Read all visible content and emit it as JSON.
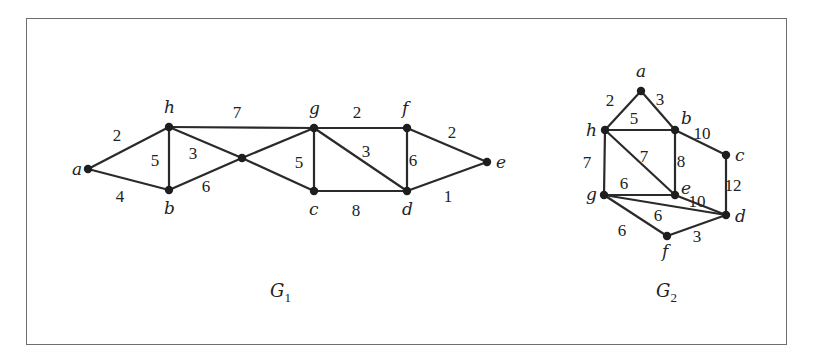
{
  "figure": {
    "graphs": [
      {
        "id": "G1",
        "caption": "G",
        "caption_sub": "1",
        "caption_pos": [
          270,
          297
        ],
        "nodes": [
          {
            "id": "a",
            "label": "a",
            "x": 88,
            "y": 169,
            "lx": 72,
            "ly": 175
          },
          {
            "id": "h",
            "label": "h",
            "x": 169,
            "y": 127,
            "lx": 164,
            "ly": 113
          },
          {
            "id": "b",
            "label": "b",
            "x": 169,
            "y": 190,
            "lx": 164,
            "ly": 214
          },
          {
            "id": "x",
            "label": "",
            "x": 242,
            "y": 158,
            "lx": 0,
            "ly": 0
          },
          {
            "id": "g",
            "label": "g",
            "x": 314,
            "y": 128,
            "lx": 309,
            "ly": 114
          },
          {
            "id": "c",
            "label": "c",
            "x": 314,
            "y": 191,
            "lx": 309,
            "ly": 215
          },
          {
            "id": "f",
            "label": "f",
            "x": 407,
            "y": 128,
            "lx": 402,
            "ly": 114
          },
          {
            "id": "d",
            "label": "d",
            "x": 407,
            "y": 191,
            "lx": 402,
            "ly": 215
          },
          {
            "id": "e",
            "label": "e",
            "x": 487,
            "y": 162,
            "lx": 496,
            "ly": 168
          }
        ],
        "edges": [
          {
            "from": "a",
            "to": "h",
            "w": "2",
            "lx": 117,
            "ly": 141
          },
          {
            "from": "a",
            "to": "b",
            "w": "4",
            "lx": 120,
            "ly": 202
          },
          {
            "from": "h",
            "to": "b",
            "w": "5",
            "lx": 155,
            "ly": 166
          },
          {
            "from": "h",
            "to": "g",
            "w": "7",
            "lx": 237,
            "ly": 118
          },
          {
            "from": "h",
            "to": "x",
            "w": "3",
            "lx": 193,
            "ly": 159
          },
          {
            "from": "x",
            "to": "c",
            "w": "",
            "lx": 0,
            "ly": 0
          },
          {
            "from": "b",
            "to": "x",
            "w": "6",
            "lx": 206,
            "ly": 192
          },
          {
            "from": "x",
            "to": "g",
            "w": "",
            "lx": 0,
            "ly": 0
          },
          {
            "from": "g",
            "to": "c",
            "w": "5",
            "lx": 299,
            "ly": 168
          },
          {
            "from": "g",
            "to": "f",
            "w": "2",
            "lx": 357,
            "ly": 118
          },
          {
            "from": "g",
            "to": "d",
            "w": "3",
            "lx": 366,
            "ly": 157
          },
          {
            "from": "c",
            "to": "d",
            "w": "8",
            "lx": 356,
            "ly": 216
          },
          {
            "from": "f",
            "to": "d",
            "w": "6",
            "lx": 413,
            "ly": 166
          },
          {
            "from": "f",
            "to": "e",
            "w": "2",
            "lx": 452,
            "ly": 138
          },
          {
            "from": "d",
            "to": "e",
            "w": "1",
            "lx": 448,
            "ly": 202
          }
        ]
      },
      {
        "id": "G2",
        "caption": "G",
        "caption_sub": "2",
        "caption_pos": [
          656,
          297
        ],
        "nodes": [
          {
            "id": "a",
            "label": "a",
            "x": 641,
            "y": 91,
            "lx": 636,
            "ly": 77
          },
          {
            "id": "h",
            "label": "h",
            "x": 605,
            "y": 130,
            "lx": 586,
            "ly": 136
          },
          {
            "id": "b",
            "label": "b",
            "x": 675,
            "y": 130,
            "lx": 681,
            "ly": 124
          },
          {
            "id": "c",
            "label": "c",
            "x": 726,
            "y": 155,
            "lx": 735,
            "ly": 161
          },
          {
            "id": "g",
            "label": "g",
            "x": 604,
            "y": 195,
            "lx": 586,
            "ly": 200
          },
          {
            "id": "e",
            "label": "e",
            "x": 675,
            "y": 195,
            "lx": 681,
            "ly": 194
          },
          {
            "id": "d",
            "label": "d",
            "x": 726,
            "y": 215,
            "lx": 735,
            "ly": 222
          },
          {
            "id": "f",
            "label": "f",
            "x": 667,
            "y": 236,
            "lx": 662,
            "ly": 257
          }
        ],
        "edges": [
          {
            "from": "a",
            "to": "h",
            "w": "2",
            "lx": 610,
            "ly": 106
          },
          {
            "from": "a",
            "to": "b",
            "w": "3",
            "lx": 660,
            "ly": 105
          },
          {
            "from": "h",
            "to": "b",
            "w": "5",
            "lx": 634,
            "ly": 124
          },
          {
            "from": "b",
            "to": "c",
            "w": "10",
            "lx": 702,
            "ly": 139
          },
          {
            "from": "h",
            "to": "g",
            "w": "7",
            "lx": 587,
            "ly": 168
          },
          {
            "from": "h",
            "to": "e",
            "w": "7",
            "lx": 644,
            "ly": 162
          },
          {
            "from": "b",
            "to": "e",
            "w": "8",
            "lx": 681,
            "ly": 167
          },
          {
            "from": "c",
            "to": "d",
            "w": "12",
            "lx": 733,
            "ly": 191
          },
          {
            "from": "g",
            "to": "e",
            "w": "6",
            "lx": 624,
            "ly": 189
          },
          {
            "from": "e",
            "to": "d",
            "w": "10",
            "lx": 697,
            "ly": 207
          },
          {
            "from": "g",
            "to": "d",
            "w": "6",
            "lx": 658,
            "ly": 221
          },
          {
            "from": "g",
            "to": "f",
            "w": "6",
            "lx": 622,
            "ly": 236
          },
          {
            "from": "f",
            "to": "d",
            "w": "3",
            "lx": 697,
            "ly": 242
          }
        ]
      }
    ]
  }
}
